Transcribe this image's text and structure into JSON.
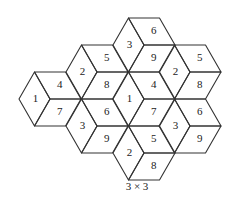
{
  "diagram": {
    "caption": "3 × 3",
    "edge": 31,
    "half_height": 27,
    "stroke_color": "#333333",
    "hexagons": [
      {
        "id": "left",
        "center": [
          50,
          99
        ],
        "labels": {
          "left": "1",
          "top": "4",
          "bottom": "7"
        }
      },
      {
        "id": "upper-left",
        "center": [
          97,
          72
        ],
        "labels": {
          "left": "2",
          "top": "5",
          "bottom": "8"
        }
      },
      {
        "id": "top",
        "center": [
          144,
          45
        ],
        "labels": {
          "left": "3",
          "top": "6",
          "bottom": "9"
        }
      },
      {
        "id": "upper-right",
        "center": [
          190,
          72
        ],
        "labels": {
          "left": "2",
          "top": "5",
          "bottom": "8"
        }
      },
      {
        "id": "center",
        "center": [
          144,
          99
        ],
        "labels": {
          "left": "1",
          "top": "4",
          "bottom": "7"
        }
      },
      {
        "id": "lower-left",
        "center": [
          97,
          126
        ],
        "labels": {
          "left": "3",
          "top": "6",
          "bottom": "9"
        }
      },
      {
        "id": "lower-right",
        "center": [
          190,
          126
        ],
        "labels": {
          "left": "3",
          "top": "6",
          "bottom": "9"
        }
      },
      {
        "id": "bottom",
        "center": [
          144,
          153
        ],
        "labels": {
          "left": "2",
          "top": "5",
          "bottom": "8"
        }
      }
    ]
  }
}
